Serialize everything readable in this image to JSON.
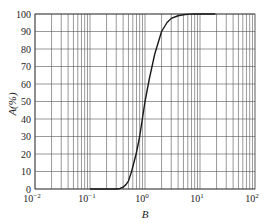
{
  "chart_data": {
    "type": "line",
    "title": "",
    "xlabel": "B",
    "ylabel": "A(%)",
    "xscale": "log",
    "xlim": [
      0.01,
      100
    ],
    "ylim": [
      0,
      100
    ],
    "grid": true,
    "legend": null,
    "x_ticks": [
      {
        "base": "10",
        "exp": "−2"
      },
      {
        "base": "10",
        "exp": "−1"
      },
      {
        "base": "10",
        "exp": "0"
      },
      {
        "base": "10",
        "exp": "1"
      },
      {
        "base": "10",
        "exp": "2"
      }
    ],
    "y_ticks": [
      "0",
      "10",
      "20",
      "30",
      "40",
      "50",
      "60",
      "70",
      "80",
      "90",
      "100"
    ],
    "series": [
      {
        "name": "A",
        "color": "#1a1a1a",
        "x": [
          0.1,
          0.2,
          0.3,
          0.35,
          0.4,
          0.45,
          0.5,
          0.57,
          0.69,
          0.8,
          1.0,
          1.2,
          1.5,
          2.0,
          2.5,
          3.0,
          4.0,
          5.0,
          6.5,
          8.0,
          10.0,
          14.0,
          19.0
        ],
        "y": [
          0,
          0,
          0,
          0.3,
          1.0,
          2.5,
          4.5,
          10,
          20,
          30,
          50,
          63,
          77,
          90,
          95,
          97.5,
          99,
          99.6,
          99.9,
          100,
          100,
          100,
          100
        ]
      }
    ]
  }
}
